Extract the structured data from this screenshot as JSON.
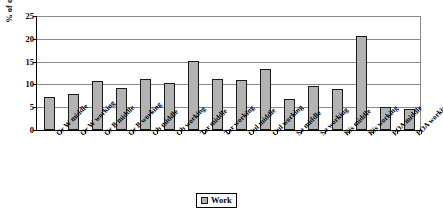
{
  "chart_data": {
    "type": "bar",
    "title": "",
    "xlabel": "",
    "ylabel": "% of observations",
    "ylim": [
      0,
      25
    ],
    "yticks": [
      0,
      5,
      10,
      15,
      20,
      25
    ],
    "grid": true,
    "legend_position": "bottom-center",
    "legend": [
      "Work"
    ],
    "categories": [
      "Gr W middle",
      "Gr W working",
      "Gr B middle",
      "Gr B working",
      "Ob middle",
      "Ob working",
      "Tar middle",
      "Tar working",
      "Oul middle",
      "Oul working",
      "Su middle",
      "Su working",
      "Kis middle",
      "Kis working",
      "POA middle",
      "POA working"
    ],
    "series": [
      {
        "name": "Work",
        "values": [
          7.3,
          8.0,
          10.7,
          9.2,
          11.1,
          10.3,
          15.2,
          11.2,
          11.0,
          13.3,
          6.9,
          9.6,
          9.0,
          20.6,
          5.0,
          4.6
        ]
      }
    ]
  },
  "axis": {
    "y_tick_labels": [
      "0",
      "5",
      "10",
      "15",
      "20",
      "25"
    ],
    "y_title": "% of observations"
  },
  "legend": {
    "entries": [
      {
        "label": "Work",
        "color": "#b3b3b3",
        "marker": "square-marker"
      }
    ]
  },
  "colors": {
    "bar_fill": "#b3b3b3",
    "bar_border": "#1a1a1a",
    "gridline": "#8a8a8a",
    "axis": "#000000",
    "background": "#ffffff"
  }
}
